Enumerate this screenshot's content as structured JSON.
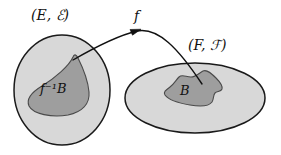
{
  "figure": {
    "background_color": "#ffffff",
    "width": 281,
    "height": 155
  },
  "colors": {
    "background": "#ffffff",
    "outer_region_fill": "#d8d8d8",
    "inner_region_fill": "#9e9e9e",
    "outline": "#1a1a1a",
    "text": "#111111",
    "arrow": "#111111"
  },
  "labels": {
    "domain_space": "(E, ℰ)",
    "codomain_space": "(F, ℱ)",
    "map": "f",
    "preimage_set": "f⁻¹B",
    "image_set": "B"
  },
  "regions": [
    {
      "name": "domain-space",
      "label": "(E, ℰ)",
      "shape": "ellipse",
      "fill": "#d8d8d8"
    },
    {
      "name": "preimage-subset",
      "label": "f⁻¹B",
      "shape": "blob",
      "fill": "#9e9e9e"
    },
    {
      "name": "codomain-space",
      "label": "(F, ℱ)",
      "shape": "ellipse",
      "fill": "#d8d8d8"
    },
    {
      "name": "image-subset",
      "label": "B",
      "shape": "blob",
      "fill": "#9e9e9e"
    }
  ],
  "arrow": {
    "label": "f",
    "from_region": "preimage-subset",
    "to_region": "image-subset",
    "style": "curved-with-arrowhead"
  }
}
